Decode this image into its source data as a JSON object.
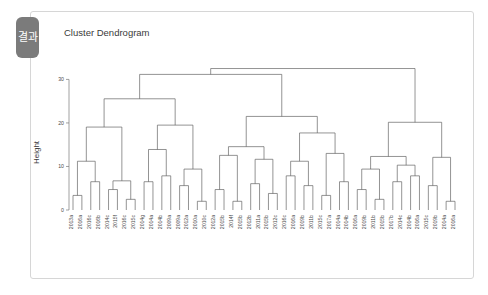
{
  "tab": {
    "label": "결과"
  },
  "panel": {
    "background": "#ffffff",
    "border_color": "#d6d6d6"
  },
  "theme": {
    "tab_background": "#7b7b7b",
    "tab_text": "#ffffff",
    "line_color": "#5a5a5a",
    "text_color": "#3a3a3a"
  },
  "chart_data": {
    "type": "dendrogram",
    "title": "Cluster Dendrogram",
    "xlabel": "",
    "ylabel": "Height",
    "ylim": [
      0,
      34
    ],
    "yticks": [
      0,
      10,
      20,
      30
    ],
    "ytick_labels": [
      "0",
      "10",
      "20",
      "30"
    ],
    "grid": false,
    "legend": false,
    "leaf_count": 44,
    "leaves": [
      "2013a",
      "2016a",
      "2016c",
      "2016b",
      "2014c",
      "2015f",
      "2016c",
      "2015c",
      "2014g",
      "2014a",
      "2014b",
      "2009a",
      "2009a",
      "2012a",
      "2010a",
      "2010c",
      "2012a",
      "2015b",
      "2014f",
      "2015b",
      "2012b",
      "2011a",
      "2015b",
      "2012c",
      "2016c",
      "2016a",
      "2019b",
      "2011b",
      "2015c",
      "2017a",
      "2014a",
      "2014b",
      "2016a",
      "2019b",
      "2011b",
      "2015b",
      "2017b",
      "2014c",
      "2014b",
      "2016a",
      "2015c",
      "2019b",
      "2014a",
      "2016a"
    ],
    "merges": [
      {
        "left": 0,
        "right": 1,
        "height": 22.5
      },
      {
        "left": 2,
        "right": 3,
        "height": 19.0
      },
      {
        "left": 4,
        "right": 5,
        "height": 17.0
      },
      {
        "left": 6,
        "right": 7,
        "height": 14.5
      },
      {
        "left": 8,
        "right": 9,
        "height": 12.0
      },
      {
        "left": 10,
        "right": 11,
        "height": 20.5
      },
      {
        "left": 12,
        "right": 13,
        "height": 32.0
      },
      {
        "left": 14,
        "right": 15,
        "height": 28.0
      },
      {
        "left": 16,
        "right": 17,
        "height": 24.0
      },
      {
        "left": 18,
        "right": 19,
        "height": 21.0
      },
      {
        "left": 20,
        "right": 21,
        "height": 18.5
      },
      {
        "left": 22,
        "right": 23,
        "height": 16.0
      },
      {
        "left": 24,
        "right": 25,
        "height": 13.5
      },
      {
        "left": 26,
        "right": 27,
        "height": 11.0
      }
    ]
  }
}
